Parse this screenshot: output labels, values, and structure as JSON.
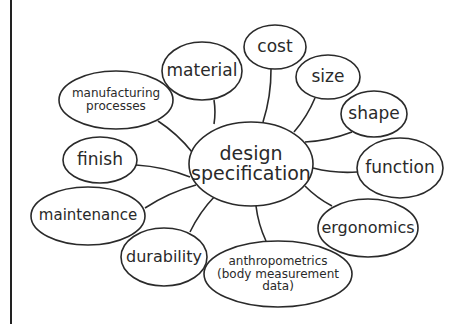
{
  "diagram": {
    "type": "mind-map",
    "colors": {
      "stroke": "#2a2a2a",
      "text": "#2a2a2a",
      "background": "#ffffff"
    },
    "center": {
      "id": "design-specification",
      "lines": [
        "design",
        "specification"
      ],
      "cx": 251,
      "cy": 164,
      "rx": 62,
      "ry": 42,
      "font": 19
    },
    "nodes": [
      {
        "id": "material",
        "lines": [
          "material"
        ],
        "cx": 202,
        "cy": 71,
        "rx": 40,
        "ry": 29,
        "font": 17,
        "link": [
          [
            214,
            100
          ],
          [
            214,
            124
          ]
        ]
      },
      {
        "id": "cost",
        "lines": [
          "cost"
        ],
        "cx": 275,
        "cy": 47,
        "rx": 31,
        "ry": 22,
        "font": 17,
        "link": [
          [
            271,
            69
          ],
          [
            263,
            122
          ]
        ]
      },
      {
        "id": "size",
        "lines": [
          "size"
        ],
        "cx": 328,
        "cy": 77,
        "rx": 32,
        "ry": 22,
        "font": 17,
        "link": [
          [
            315,
            98
          ],
          [
            294,
            132
          ]
        ]
      },
      {
        "id": "shape",
        "lines": [
          "shape"
        ],
        "cx": 374,
        "cy": 114,
        "rx": 33,
        "ry": 23,
        "font": 17,
        "link": [
          [
            352,
            132
          ],
          [
            305,
            142
          ]
        ]
      },
      {
        "id": "function",
        "lines": [
          "function"
        ],
        "cx": 400,
        "cy": 168,
        "rx": 43,
        "ry": 30,
        "font": 17,
        "link": [
          [
            357,
            172
          ],
          [
            313,
            168
          ]
        ]
      },
      {
        "id": "ergonomics",
        "lines": [
          "ergonomics"
        ],
        "cx": 368,
        "cy": 228,
        "rx": 50,
        "ry": 29,
        "font": 16,
        "link": [
          [
            332,
            206
          ],
          [
            305,
            186
          ]
        ]
      },
      {
        "id": "anthropometrics",
        "lines": [
          "anthropometrics",
          "(body measurement",
          "data)"
        ],
        "cx": 278,
        "cy": 274,
        "rx": 74,
        "ry": 33,
        "font": 12,
        "link": [
          [
            266,
            241
          ],
          [
            256,
            206
          ]
        ]
      },
      {
        "id": "durability",
        "lines": [
          "durability"
        ],
        "cx": 164,
        "cy": 257,
        "rx": 43,
        "ry": 29,
        "font": 16,
        "link": [
          [
            190,
            232
          ],
          [
            215,
            196
          ]
        ]
      },
      {
        "id": "maintenance",
        "lines": [
          "maintenance"
        ],
        "cx": 88,
        "cy": 216,
        "rx": 57,
        "ry": 29,
        "font": 15,
        "link": [
          [
            145,
            208
          ],
          [
            196,
            185
          ]
        ]
      },
      {
        "id": "finish",
        "lines": [
          "finish"
        ],
        "cx": 100,
        "cy": 160,
        "rx": 37,
        "ry": 23,
        "font": 17,
        "link": [
          [
            136,
            165
          ],
          [
            190,
            177
          ]
        ]
      },
      {
        "id": "manufacturing-processes",
        "lines": [
          "manufacturing",
          "processes"
        ],
        "cx": 116,
        "cy": 100,
        "rx": 57,
        "ry": 29,
        "font": 12,
        "link": [
          [
            158,
            121
          ],
          [
            192,
            152
          ]
        ]
      }
    ]
  }
}
